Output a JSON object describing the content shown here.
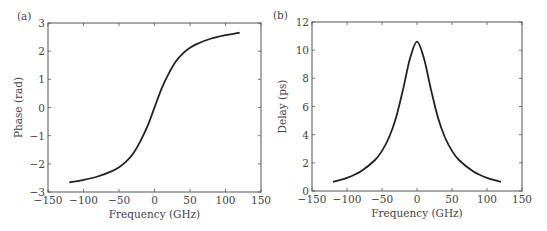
{
  "chart_data": [
    {
      "panel_label": "(a)",
      "type": "line",
      "title": "",
      "xlabel": "Frequency (GHz)",
      "ylabel": "Phase (rad)",
      "xlim": [
        -150,
        150
      ],
      "ylim": [
        -3,
        3
      ],
      "xticks": [
        -150,
        -100,
        -50,
        0,
        50,
        100,
        150
      ],
      "yticks": [
        -3,
        -2,
        -1,
        0,
        1,
        2,
        3
      ],
      "xtick_labels": [
        "−150",
        "−100",
        "−50",
        "0",
        "50",
        "100",
        "150"
      ],
      "ytick_labels": [
        "−3",
        "−2",
        "−1",
        "0",
        "1",
        "2",
        "3"
      ],
      "grid": false,
      "series": [
        {
          "name": "phase",
          "x": [
            -120,
            -100,
            -80,
            -60,
            -50,
            -40,
            -30,
            -20,
            -10,
            0,
            10,
            20,
            30,
            40,
            50,
            60,
            80,
            100,
            120
          ],
          "y": [
            -2.66,
            -2.57,
            -2.45,
            -2.26,
            -2.12,
            -1.92,
            -1.63,
            -1.2,
            -0.67,
            0,
            0.67,
            1.2,
            1.63,
            1.92,
            2.12,
            2.26,
            2.45,
            2.57,
            2.66
          ]
        }
      ]
    },
    {
      "panel_label": "(b)",
      "type": "line",
      "title": "",
      "xlabel": "Frequency (GHz)",
      "ylabel": "Delay (ps)",
      "xlim": [
        -150,
        150
      ],
      "ylim": [
        0,
        12
      ],
      "xticks": [
        -150,
        -100,
        -50,
        0,
        50,
        100,
        150
      ],
      "yticks": [
        0,
        2,
        4,
        6,
        8,
        10,
        12
      ],
      "xtick_labels": [
        "−150",
        "−100",
        "−50",
        "0",
        "50",
        "100",
        "150"
      ],
      "ytick_labels": [
        "0",
        "2",
        "4",
        "6",
        "8",
        "10",
        "12"
      ],
      "grid": false,
      "series": [
        {
          "name": "delay",
          "x": [
            -120,
            -100,
            -80,
            -60,
            -50,
            -40,
            -30,
            -20,
            -10,
            0,
            10,
            20,
            30,
            40,
            50,
            60,
            80,
            100,
            120
          ],
          "y": [
            0.65,
            0.93,
            1.4,
            2.2,
            2.85,
            3.8,
            5.2,
            7.2,
            9.4,
            10.6,
            9.4,
            7.2,
            5.2,
            3.8,
            2.85,
            2.2,
            1.4,
            0.93,
            0.65
          ]
        }
      ]
    }
  ]
}
